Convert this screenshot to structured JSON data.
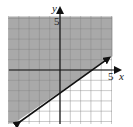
{
  "chart_data": {
    "type": "inequality-graph",
    "title": "",
    "xlabel": "x",
    "ylabel": "y",
    "xlim": [
      -5,
      5
    ],
    "ylim": [
      -5,
      5
    ],
    "x_tick_label": "5",
    "y_tick_label": "5",
    "grid": true,
    "boundary_line": {
      "slope": 0.6667,
      "intercept": -2,
      "style": "solid",
      "points": [
        [
          -4.5,
          -5
        ],
        [
          4.8,
          1.2
        ]
      ]
    },
    "shaded_region": "above-left of line",
    "colors": {
      "shade": "#9a9a9a",
      "line": "#111111",
      "grid": "#c8c8c8"
    }
  }
}
